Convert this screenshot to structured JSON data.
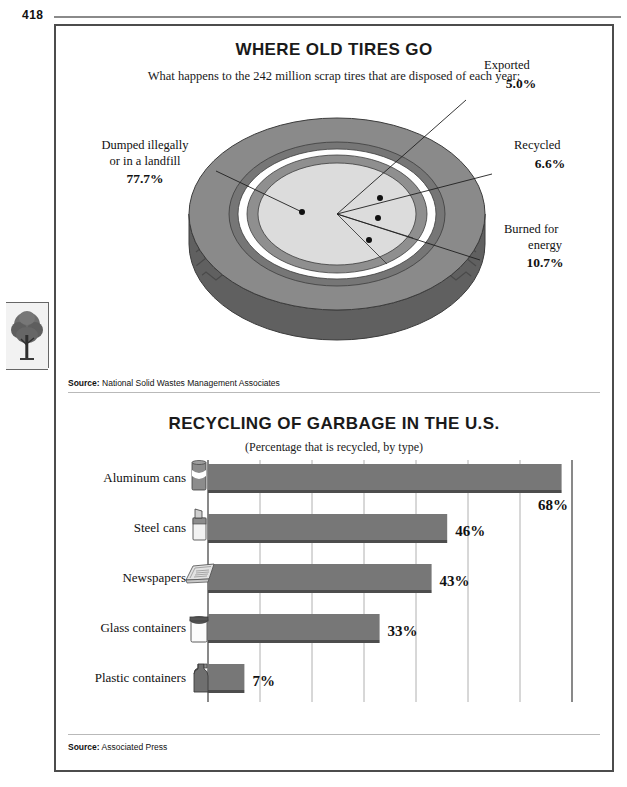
{
  "page": {
    "number": "418"
  },
  "margin": {
    "tree_icon": "tree-icon"
  },
  "figure1": {
    "title": "WHERE OLD TIRES GO",
    "subtitle": "What happens to the 242 million scrap tires that are disposed of each year:",
    "source_label": "Source:",
    "source_text": "National Solid Wastes Management Associates",
    "callouts": [
      {
        "label_line1": "Dumped illegally",
        "label_line2": "or in a landfill",
        "value": "77.7%"
      },
      {
        "label_line1": "Exported",
        "label_line2": "",
        "value": "5.0%"
      },
      {
        "label_line1": "Recycled",
        "label_line2": "",
        "value": "6.6%"
      },
      {
        "label_line1": "Burned for",
        "label_line2": "energy",
        "value": "10.7%"
      }
    ],
    "colors": {
      "tire_dark": "#6f6f6f",
      "tire_mid": "#8a8a8a",
      "tire_light": "#dcdcdc",
      "tire_white": "#ffffff",
      "outline": "#3c3c3c"
    }
  },
  "chart_data": {
    "type": "bar",
    "orientation": "horizontal",
    "title": "RECYCLING OF GARBAGE IN THE U.S.",
    "subtitle": "(Percentage that is recycled, by type)",
    "xlabel": "",
    "ylabel": "",
    "xlim": [
      0,
      70
    ],
    "gridlines": [
      10,
      20,
      30,
      40,
      50,
      60,
      70
    ],
    "grid": true,
    "legend": "none",
    "categories": [
      "Aluminum cans",
      "Steel cans",
      "Newspapers",
      "Glass containers",
      "Plastic containers"
    ],
    "values": [
      68,
      46,
      43,
      33,
      7
    ],
    "value_labels": [
      "68%",
      "46%",
      "43%",
      "33%",
      "7%"
    ],
    "icons": [
      "aluminum-can-icon",
      "steel-can-icon",
      "newspapers-icon",
      "glass-jar-icon",
      "plastic-jug-icon"
    ],
    "bar_color": "#777777",
    "source_label": "Source:",
    "source_text": "Associated Press"
  }
}
